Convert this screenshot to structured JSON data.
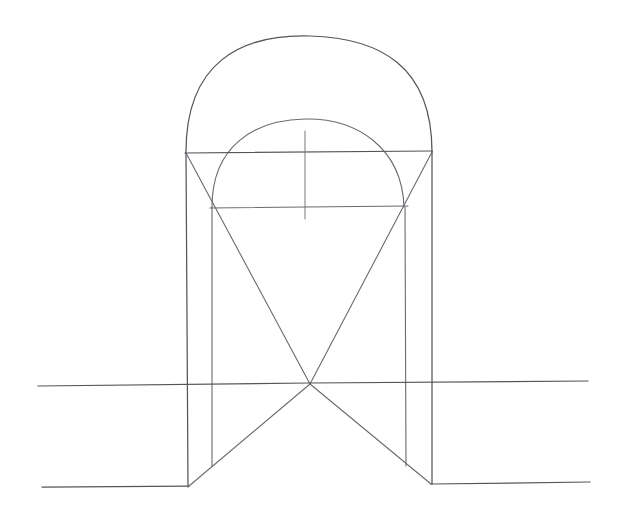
{
  "document": {
    "kind": "hand-drawn-sketch",
    "title": "Arched vault perspective construction drawing",
    "medium": "pencil on paper",
    "background_color": "#ffffff",
    "ink_color": "#55555a",
    "canvas": {
      "width": 617,
      "height": 520
    }
  },
  "drawing": {
    "description": "Freehand geometric construction: a large semicircular arch enclosing a smaller semicircular arch, resting on a rectangular pier frame, with crossing diagonals forming an X below, cut by a long horizontal ground line and a broken baseline.",
    "key_points": {
      "outer_arch_apex": {
        "x": 310,
        "y": 36
      },
      "inner_arch_apex": {
        "x": 305,
        "y": 119
      },
      "x_crossing": {
        "x": 310,
        "y": 384
      },
      "left_outer_pier": 186,
      "left_inner_pier": 211,
      "right_inner_pier": 405,
      "right_outer_pier": 432
    },
    "elements": [
      {
        "name": "outer-arch",
        "label": "Outer semicircular arch",
        "type": "arc",
        "path": "M 186,152 C 186,63 240,34 310,36 C 380,38 432,66 432,152"
      },
      {
        "name": "inner-arch",
        "label": "Inner semicircular arch",
        "type": "arc",
        "path": "M 212,207 C 212,147 253,120 305,119 C 357,118 402,148 404,207"
      },
      {
        "name": "springline",
        "label": "Upper horizontal springline",
        "type": "line",
        "path": "M 185,153 L 432,151"
      },
      {
        "name": "impost-line",
        "label": "Lower horizontal impost line",
        "type": "line",
        "path": "M 210,208 L 408,206"
      },
      {
        "name": "center-tick",
        "label": "Central vertical axis tick",
        "type": "line",
        "path": "M 305,131 L 305,219"
      },
      {
        "name": "left-outer-pier",
        "label": "Left outer vertical pier line",
        "type": "line",
        "path": "M 186,152 L 188,487"
      },
      {
        "name": "left-inner-pier",
        "label": "Left inner vertical pier line",
        "type": "line",
        "path": "M 212,207 L 212,466"
      },
      {
        "name": "right-inner-pier",
        "label": "Right inner vertical pier line",
        "type": "line",
        "path": "M 405,207 L 406,466"
      },
      {
        "name": "right-outer-pier",
        "label": "Right outer vertical pier line",
        "type": "line",
        "path": "M 432,151 L 432,484"
      },
      {
        "name": "diagonal-upper-left",
        "label": "Diagonal from top-left corner to X crossing",
        "type": "line",
        "path": "M 186,153 L 310,384"
      },
      {
        "name": "diagonal-upper-right",
        "label": "Diagonal from top-right corner to X crossing",
        "type": "line",
        "path": "M 432,152 L 310,384"
      },
      {
        "name": "diagonal-lower-left",
        "label": "Diagonal from X crossing down to left base",
        "type": "line",
        "path": "M 310,384 L 189,486"
      },
      {
        "name": "diagonal-lower-right",
        "label": "Diagonal from X crossing down to right base",
        "type": "line",
        "path": "M 310,384 L 431,484"
      },
      {
        "name": "ground-line",
        "label": "Long horizontal ground / horizon line",
        "type": "line",
        "path": "M 38,386 L 310,383 L 588,381"
      },
      {
        "name": "baseline-left",
        "label": "Left baseline segment",
        "type": "line",
        "path": "M 42,487 L 189,486"
      },
      {
        "name": "baseline-right",
        "label": "Right baseline segment",
        "type": "line",
        "path": "M 431,484 L 590,482"
      }
    ]
  }
}
